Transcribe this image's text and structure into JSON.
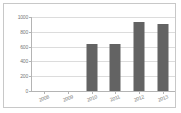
{
  "chart_data": {
    "type": "bar",
    "title": "",
    "subtitle": "",
    "xlabel": "",
    "ylabel": "",
    "categories": [
      "2008",
      "2009",
      "2010",
      "2011",
      "2012",
      "2013"
    ],
    "values": [
      0,
      0,
      640,
      630,
      930,
      900
    ],
    "series": [
      {
        "name": "",
        "values": [
          0,
          0,
          640,
          630,
          930,
          900
        ]
      }
    ],
    "ylim": [
      0,
      1000
    ],
    "yticks": [
      0,
      200,
      400,
      600,
      800,
      1000
    ],
    "ytick_labels": [
      "0",
      "200",
      "400",
      "600",
      "800",
      "1000"
    ],
    "grid": true,
    "legend": false,
    "legend_position": "none",
    "bar_color": "#636363",
    "grid_color": "#dcdcdc",
    "axis_color": "#b4b4b4",
    "tick_label_color": "#777777",
    "frame_color": "#c8c8c8",
    "background_color": "#ffffff",
    "annotations": []
  }
}
